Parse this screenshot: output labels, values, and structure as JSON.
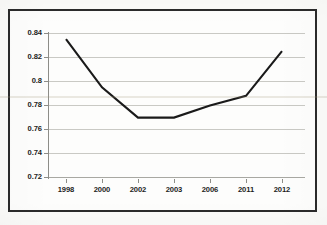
{
  "chart_data": {
    "type": "line",
    "title": "",
    "subtitle": "",
    "xlabel": "",
    "ylabel": "",
    "categories": [
      "1998",
      "2000",
      "2002",
      "2003",
      "2006",
      "2011",
      "2012"
    ],
    "values": [
      0.835,
      0.795,
      0.77,
      0.77,
      0.78,
      0.788,
      0.825
    ],
    "series": [
      {
        "name": "series-1",
        "values": [
          0.835,
          0.795,
          0.77,
          0.77,
          0.78,
          0.788,
          0.825
        ],
        "color": "#1a1a1a"
      }
    ],
    "ylim": [
      0.72,
      0.84
    ],
    "ytick_values": [
      0.84,
      0.82,
      0.8,
      0.78,
      0.76,
      0.74,
      0.72
    ],
    "ytick_labels": [
      "0.84",
      "0.82",
      "0.8",
      "0.78",
      "0.76",
      "0.74",
      "0.72"
    ],
    "grid": true,
    "grid_axis": "y",
    "legend": false,
    "legend_position": "none",
    "markers": false,
    "annotations": []
  },
  "figure": {
    "background_color": "#fdfdfc",
    "frame_color": "#2b2b2b",
    "gridline_color": "#c9c9c4",
    "axis_color": "#8d8d88",
    "line_color": "#1a1a1a",
    "label_color": "#1d1d1d"
  }
}
